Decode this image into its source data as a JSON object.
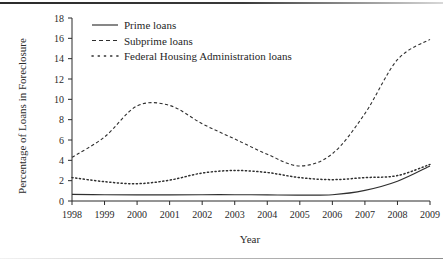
{
  "chart_data": {
    "type": "line",
    "title": "",
    "xlabel": "Year",
    "ylabel": "Percentage of Loans in Foreclosure",
    "x": [
      1998,
      1999,
      2000,
      2001,
      2002,
      2003,
      2004,
      2005,
      2006,
      2007,
      2008,
      2009
    ],
    "xtick_labels": [
      "1998",
      "1999",
      "2000",
      "2001",
      "2002",
      "2003",
      "2004",
      "2005",
      "2006",
      "2007",
      "2008",
      "2009"
    ],
    "ytick_labels": [
      "0",
      "2",
      "4",
      "6",
      "8",
      "10",
      "12",
      "14",
      "16",
      "18"
    ],
    "ytick_values": [
      0,
      2,
      4,
      6,
      8,
      10,
      12,
      14,
      16,
      18
    ],
    "xlim": [
      1998,
      2009
    ],
    "ylim": [
      0,
      18
    ],
    "grid": false,
    "legend_position": "top-left-inside",
    "series": [
      {
        "name": "Prime loans",
        "style": "solid",
        "color": "#2f2f2f",
        "values": [
          0.65,
          0.62,
          0.6,
          0.6,
          0.62,
          0.62,
          0.6,
          0.58,
          0.62,
          1.05,
          1.95,
          3.45
        ]
      },
      {
        "name": "Subprime loans",
        "style": "dashed",
        "color": "#2f2f2f",
        "values": [
          4.3,
          6.3,
          9.35,
          9.4,
          7.6,
          6.1,
          4.6,
          3.45,
          4.65,
          8.6,
          13.9,
          15.9
        ]
      },
      {
        "name": "Federal Housing Administration loans",
        "style": "dotted",
        "color": "#2f2f2f",
        "values": [
          2.3,
          1.9,
          1.7,
          2.05,
          2.75,
          3.0,
          2.8,
          2.3,
          2.1,
          2.3,
          2.5,
          3.6
        ]
      }
    ]
  },
  "legend": {
    "items": [
      {
        "label": "Prime loans",
        "style": "solid"
      },
      {
        "label": "Subprime loans",
        "style": "dashed"
      },
      {
        "label": "Federal Housing Administration loans",
        "style": "dotted"
      }
    ]
  },
  "axes": {
    "x_title": "Year",
    "y_title": "Percentage of Loans in Foreclosure"
  }
}
